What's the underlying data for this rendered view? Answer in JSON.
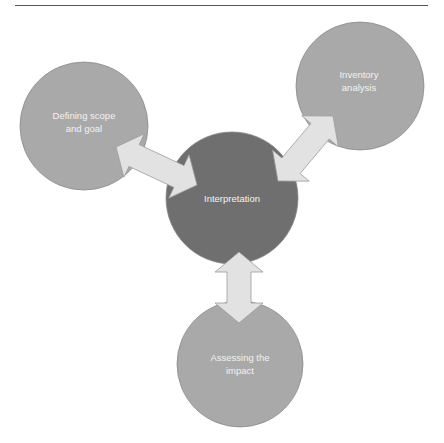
{
  "diagram": {
    "type": "cycle-hub",
    "center": {
      "label": "Interpretation",
      "cx": 232,
      "cy": 198,
      "r": 66,
      "fill": "#6f6f6f"
    },
    "nodes": [
      {
        "id": "scope",
        "label": "Defining scope\nand goal",
        "cx": 84,
        "cy": 126,
        "r": 64,
        "fill": "#a9a9a9",
        "label_x": 84,
        "label_y": 122
      },
      {
        "id": "inventory",
        "label": "Inventory\nanalysis",
        "cx": 360,
        "cy": 86,
        "r": 64,
        "fill": "#a9a9a9",
        "label_x": 359,
        "label_y": 81
      },
      {
        "id": "impact",
        "label": "Assessing the\nimpact",
        "cx": 240,
        "cy": 364,
        "r": 63,
        "fill": "#a9a9a9",
        "label_x": 240,
        "label_y": 364
      }
    ],
    "arrows": [
      {
        "id": "scope-interpretation",
        "from": [
          116,
          147
        ],
        "to": [
          197,
          185
        ]
      },
      {
        "id": "inventory-interpretation",
        "from": [
          333,
          116
        ],
        "to": [
          278,
          181
        ]
      },
      {
        "id": "interpretation-impact",
        "from": [
          239,
          252
        ],
        "to": [
          239,
          323
        ]
      }
    ],
    "arrow_fill": "#e2e2e2",
    "arrow_stroke": "#9c9c9c",
    "label_color": "#f2f2f2"
  }
}
